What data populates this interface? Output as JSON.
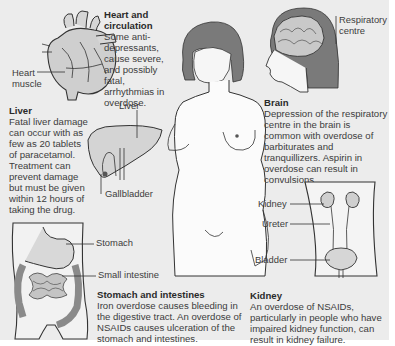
{
  "sections": {
    "heart": {
      "heading": "Heart and circulation",
      "heading_line1": "Heart and",
      "heading_line2": "circulation",
      "body": "Some anti-depressants, cause severe, and possibly fatal, arrhythmias in overdose.",
      "label_muscle_1": "Heart",
      "label_muscle_2": "muscle"
    },
    "liver": {
      "heading": "Liver",
      "body": "Fatal liver damage can occur with as few as 20 tablets of paracetamol. Treatment can prevent damage but must be given within 12 hours of taking the drug.",
      "label_liver": "Liver",
      "label_gallbladder": "Gallbladder"
    },
    "stomach": {
      "heading": "Stomach and intestines",
      "body": "Iron overdose causes bleeding in the digestive tract. An overdose of NSAIDs causes ulceration of the stomach and intestines.",
      "label_stomach": "Stomach",
      "label_small_intestine": "Small intestine"
    },
    "brain": {
      "heading": "Brain",
      "body": "Depression of the respiratory centre in the brain is common with overdose of barbiturates and tranquillizers. Aspirin in overdose can result in convulsions.",
      "label_resp_1": "Respiratory",
      "label_resp_2": "centre"
    },
    "kidney": {
      "heading": "Kidney",
      "body": "An overdose of NSAIDs, particularly in people who have impaired kidney function, can result in kidney failure.",
      "label_kidney": "Kidney",
      "label_ureter": "Ureter",
      "label_bladder": "Bladder"
    }
  },
  "colors": {
    "background": "#ececec",
    "organ_fill": "#c9c9c9",
    "organ_dark": "#8f8f8f",
    "hair": "#7a7a7a",
    "line": "#333333"
  }
}
